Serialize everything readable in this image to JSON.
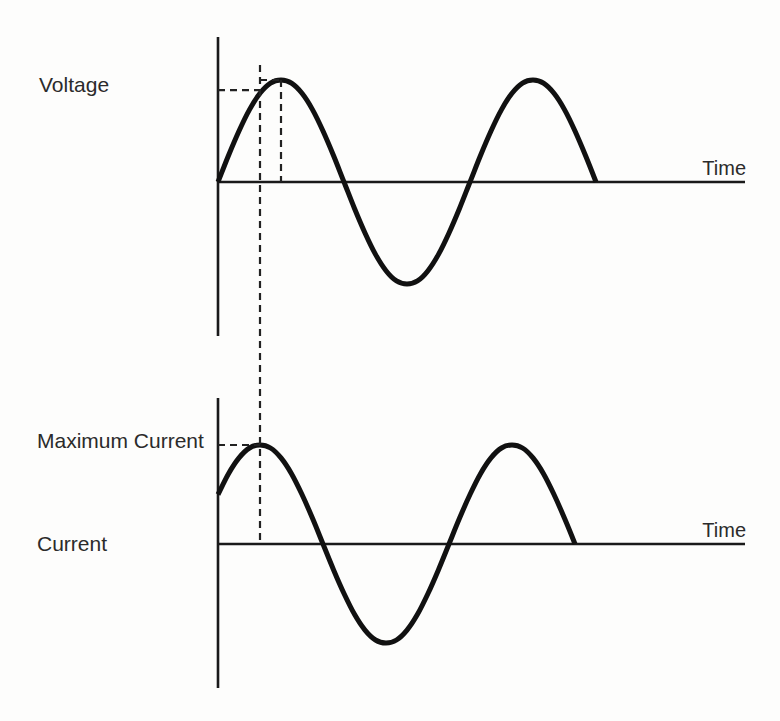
{
  "figure": {
    "voltage_label": "Voltage",
    "max_current_label": "Maximum Current",
    "current_label": "Current",
    "time_label_top": "Time",
    "time_label_bottom": "Time"
  },
  "colors": {
    "ink": "#111111",
    "text": "#2b2b2b",
    "background": "#fdfdfc"
  },
  "chart_data": [
    {
      "type": "line",
      "title": "",
      "panel": "top",
      "ylabel": "Voltage",
      "xlabel": "Time",
      "x_units": "phase (degrees, approx.)",
      "grid": false,
      "x": [
        0,
        15,
        30,
        45,
        60,
        75,
        90,
        105,
        120,
        135,
        150,
        165,
        180,
        195,
        210,
        225,
        240,
        255,
        270,
        285,
        300,
        315,
        330,
        345,
        360,
        375,
        390,
        405,
        420,
        435,
        450,
        465,
        480,
        495,
        510,
        525,
        540
      ],
      "series": [
        {
          "name": "Voltage",
          "values": [
            0,
            0.26,
            0.5,
            0.71,
            0.87,
            0.97,
            1,
            0.97,
            0.87,
            0.71,
            0.5,
            0.26,
            0,
            -0.26,
            -0.5,
            -0.71,
            -0.87,
            -0.97,
            -1,
            -0.97,
            -0.87,
            -0.71,
            -0.5,
            -0.26,
            0,
            0.26,
            0.5,
            0.71,
            0.87,
            0.97,
            1,
            0.97,
            0.87,
            0.71,
            0.5,
            0.26,
            0
          ]
        }
      ],
      "xlim": [
        0,
        755
      ],
      "ylim": [
        -1.5,
        1.45
      ],
      "annotations": [
        {
          "kind": "hline",
          "style": "dashed",
          "y": 0.9,
          "x_from": 0,
          "x_to": 62
        },
        {
          "kind": "hline",
          "style": "dashed",
          "y": 1.0,
          "x_from": 60,
          "x_to": 90
        },
        {
          "kind": "vline",
          "style": "dashed",
          "x": 90,
          "y_from": 1.0,
          "y_to": 0
        }
      ]
    },
    {
      "type": "line",
      "title": "",
      "panel": "bottom",
      "ylabel": "Current",
      "xlabel": "Time",
      "x_units": "phase (degrees, approx.)",
      "grid": false,
      "x": [
        0,
        15,
        30,
        45,
        60,
        75,
        90,
        105,
        120,
        135,
        150,
        165,
        180,
        195,
        210,
        225,
        240,
        255,
        270,
        285,
        300,
        315,
        330,
        345,
        360,
        375,
        390,
        405,
        420,
        435,
        450,
        465,
        480,
        495,
        510
      ],
      "series": [
        {
          "name": "Current",
          "values": [
            0.5,
            0.71,
            0.87,
            0.97,
            1,
            0.97,
            0.87,
            0.71,
            0.5,
            0.26,
            0,
            -0.26,
            -0.5,
            -0.71,
            -0.87,
            -0.97,
            -1,
            -0.97,
            -0.87,
            -0.71,
            -0.5,
            -0.26,
            0,
            0.26,
            0.5,
            0.71,
            0.87,
            0.97,
            1,
            0.97,
            0.87,
            0.71,
            0.5,
            0.26,
            0
          ]
        }
      ],
      "xlim": [
        0,
        755
      ],
      "ylim": [
        -1.45,
        1.45
      ],
      "annotations": [
        {
          "kind": "hline",
          "style": "dashed",
          "y": 1.0,
          "x_from": 0,
          "x_to": 60,
          "label": "Maximum Current"
        }
      ]
    }
  ],
  "shared_annotations": [
    {
      "kind": "vline",
      "style": "dashed",
      "x": 60,
      "spans": "both-panels",
      "note": "instant of maximum current"
    }
  ]
}
